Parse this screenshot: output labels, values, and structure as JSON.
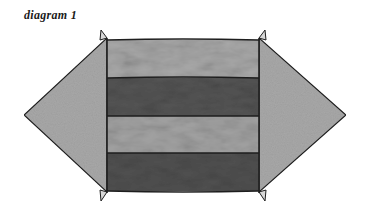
{
  "caption": "diagram 1",
  "figure": {
    "stripes": [
      {
        "index": 1,
        "tone": "light",
        "color": "#a9a9a9"
      },
      {
        "index": 2,
        "tone": "dark",
        "color": "#555555"
      },
      {
        "index": 3,
        "tone": "light",
        "color": "#a4a4a4"
      },
      {
        "index": 4,
        "tone": "dark",
        "color": "#515151"
      }
    ],
    "arrows": [
      {
        "side": "left",
        "direction": "pointing-left",
        "color": "#a8a8a8"
      },
      {
        "side": "right",
        "direction": "pointing-right",
        "color": "#a8a8a8"
      }
    ],
    "outline_color": "#1e1e1e"
  }
}
